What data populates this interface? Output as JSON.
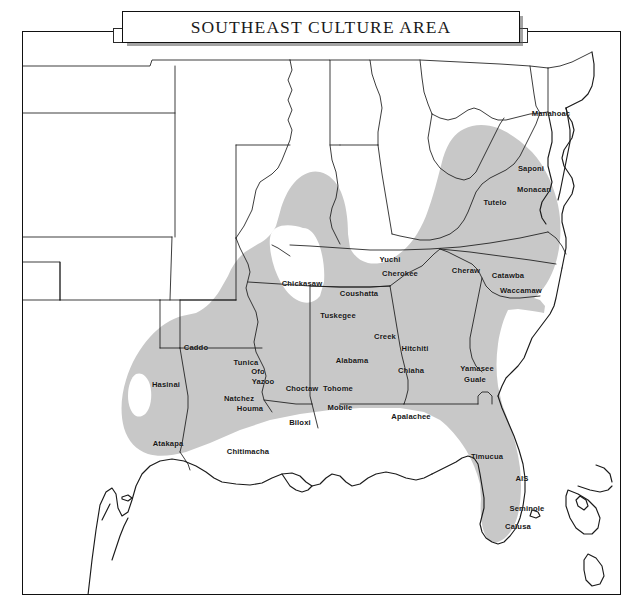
{
  "title": {
    "text": "SOUTHEAST CULTURE AREA"
  },
  "map": {
    "region_name": "Southeast Culture Area",
    "shade_color": "#c8c8c8",
    "outline_color": "#1a1a1a",
    "background_color": "#ffffff",
    "frame_color": "#111111"
  },
  "labels": [
    {
      "name": "Manahoac",
      "x": 551,
      "y": 114
    },
    {
      "name": "Saponi",
      "x": 531,
      "y": 169
    },
    {
      "name": "Monacan",
      "x": 534,
      "y": 190
    },
    {
      "name": "Tutelo",
      "x": 495,
      "y": 203
    },
    {
      "name": "Yuchi",
      "x": 390,
      "y": 260
    },
    {
      "name": "Cherokee",
      "x": 400,
      "y": 274
    },
    {
      "name": "Cheraw",
      "x": 466,
      "y": 271
    },
    {
      "name": "Catawba",
      "x": 508,
      "y": 276
    },
    {
      "name": "Waccamaw",
      "x": 521,
      "y": 291
    },
    {
      "name": "Chickasaw",
      "x": 302,
      "y": 284
    },
    {
      "name": "Coushatta",
      "x": 359,
      "y": 294
    },
    {
      "name": "Tuskegee",
      "x": 338,
      "y": 316
    },
    {
      "name": "Creek",
      "x": 385,
      "y": 337
    },
    {
      "name": "Hitchiti",
      "x": 415,
      "y": 349
    },
    {
      "name": "Alabama",
      "x": 352,
      "y": 361
    },
    {
      "name": "Chiaha",
      "x": 411,
      "y": 371
    },
    {
      "name": "Yamasee",
      "x": 477,
      "y": 369
    },
    {
      "name": "Guale",
      "x": 475,
      "y": 380
    },
    {
      "name": "Caddo",
      "x": 196,
      "y": 348
    },
    {
      "name": "Tunica",
      "x": 246,
      "y": 363
    },
    {
      "name": "Ofo",
      "x": 258,
      "y": 372
    },
    {
      "name": "Yazoo",
      "x": 263,
      "y": 382
    },
    {
      "name": "Natchez",
      "x": 239,
      "y": 399
    },
    {
      "name": "Houma",
      "x": 250,
      "y": 409
    },
    {
      "name": "Hasinai",
      "x": 166,
      "y": 385
    },
    {
      "name": "Choctaw",
      "x": 302,
      "y": 389
    },
    {
      "name": "Tohome",
      "x": 338,
      "y": 389
    },
    {
      "name": "Mobile",
      "x": 340,
      "y": 408
    },
    {
      "name": "Biloxi",
      "x": 300,
      "y": 423
    },
    {
      "name": "Atakapa",
      "x": 168,
      "y": 444
    },
    {
      "name": "Chitimacha",
      "x": 248,
      "y": 452
    },
    {
      "name": "Apalachee",
      "x": 411,
      "y": 417
    },
    {
      "name": "Timucua",
      "x": 487,
      "y": 457
    },
    {
      "name": "AIS",
      "x": 522,
      "y": 479
    },
    {
      "name": "Seminole",
      "x": 527,
      "y": 509
    },
    {
      "name": "Calusa",
      "x": 518,
      "y": 527
    }
  ]
}
